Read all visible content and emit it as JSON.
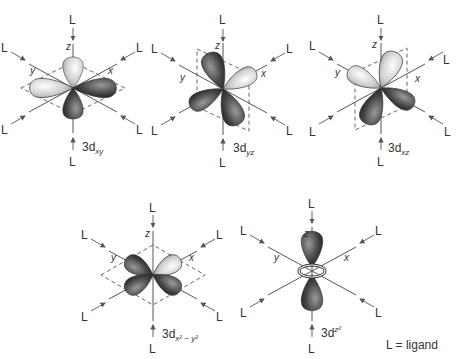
{
  "figure": {
    "ligand_label": "L",
    "axis_labels": {
      "x": "x",
      "y": "y",
      "z": "z"
    },
    "legend": "L = ligand",
    "orbitals": [
      {
        "id": "dxy",
        "prefix": "3d",
        "subscript": "xy",
        "center": [
          73,
          88
        ]
      },
      {
        "id": "dyz",
        "prefix": "3d",
        "subscript": "yz",
        "center": [
          223,
          89
        ]
      },
      {
        "id": "dxz",
        "prefix": "3d",
        "subscript": "xz",
        "center": [
          381,
          88
        ]
      },
      {
        "id": "dx2y2",
        "prefix": "3d",
        "subscript": "x² − y²",
        "center": [
          153,
          275
        ]
      },
      {
        "id": "dz2",
        "prefix": "3d",
        "subscript": "z²",
        "center": [
          312,
          271
        ]
      }
    ]
  },
  "colors": {
    "lobe_dark": "#2a2a2a",
    "lobe_light": "#f2f2f2",
    "lines": "#555555",
    "text": "#333333"
  }
}
